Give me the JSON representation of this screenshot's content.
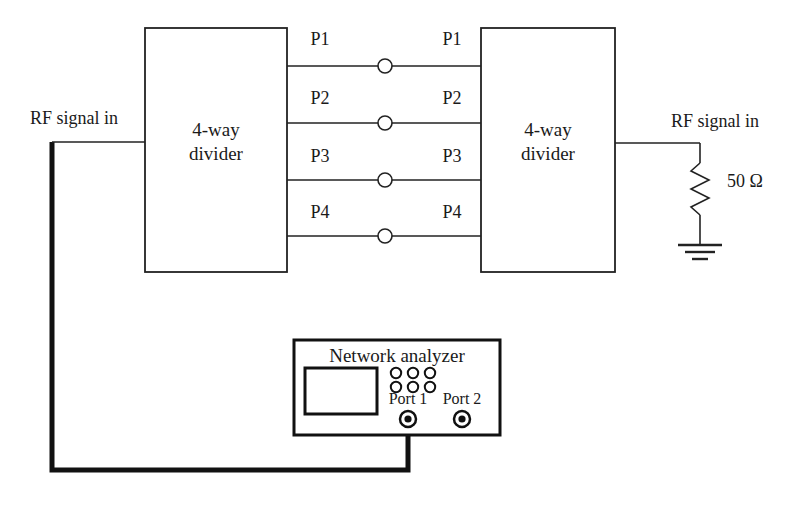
{
  "diagram": {
    "stroke_color": "#222222",
    "cable_color": "#111111",
    "background": "#ffffff"
  },
  "blocks": {
    "left_divider": {
      "line1": "4-way",
      "line2": "divider"
    },
    "right_divider": {
      "line1": "4-way",
      "line2": "divider"
    }
  },
  "labels": {
    "rf_in_left": "RF signal in",
    "rf_in_right": "RF signal in",
    "load": "50 Ω"
  },
  "ports": {
    "left_side": [
      "P1",
      "P2",
      "P3",
      "P4"
    ],
    "right_side": [
      "P1",
      "P2",
      "P3",
      "P4"
    ]
  },
  "analyzer": {
    "title": "Network analyzer",
    "port1_label": "Port 1",
    "port2_label": "Port 2",
    "knob_rows": 2,
    "knobs_per_row": 3
  }
}
